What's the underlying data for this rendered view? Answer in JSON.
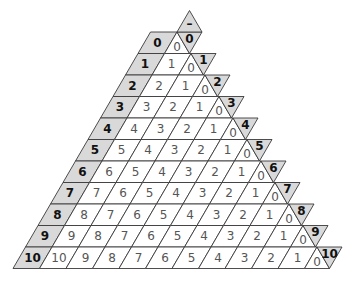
{
  "diagram": {
    "apex_label": "–",
    "rows": [
      {
        "label": "0",
        "values": [],
        "zero": "0",
        "end_label": "0"
      },
      {
        "label": "1",
        "values": [
          "1"
        ],
        "zero": "0",
        "end_label": "1"
      },
      {
        "label": "2",
        "values": [
          "2",
          "1"
        ],
        "zero": "0",
        "end_label": "2"
      },
      {
        "label": "3",
        "values": [
          "3",
          "2",
          "1"
        ],
        "zero": "0",
        "end_label": "3"
      },
      {
        "label": "4",
        "values": [
          "4",
          "3",
          "2",
          "1"
        ],
        "zero": "0",
        "end_label": "4"
      },
      {
        "label": "5",
        "values": [
          "5",
          "4",
          "3",
          "2",
          "1"
        ],
        "zero": "0",
        "end_label": "5"
      },
      {
        "label": "6",
        "values": [
          "6",
          "5",
          "4",
          "3",
          "2",
          "1"
        ],
        "zero": "0",
        "end_label": "6"
      },
      {
        "label": "7",
        "values": [
          "7",
          "6",
          "5",
          "4",
          "3",
          "2",
          "1"
        ],
        "zero": "0",
        "end_label": "7"
      },
      {
        "label": "8",
        "values": [
          "8",
          "7",
          "6",
          "5",
          "4",
          "3",
          "2",
          "1"
        ],
        "zero": "0",
        "end_label": "8"
      },
      {
        "label": "9",
        "values": [
          "9",
          "8",
          "7",
          "6",
          "5",
          "4",
          "3",
          "2",
          "1"
        ],
        "zero": "0",
        "end_label": "9"
      },
      {
        "label": "10",
        "values": [
          "10",
          "9",
          "8",
          "7",
          "6",
          "5",
          "4",
          "3",
          "2",
          "1"
        ],
        "zero": "0",
        "end_label": "10"
      }
    ],
    "colors": {
      "label_fill": "#d9d9d9",
      "cell_fill": "#ffffff",
      "stroke": "#3a3a3a",
      "label_text": "#111111",
      "value_text": "#555555"
    }
  }
}
